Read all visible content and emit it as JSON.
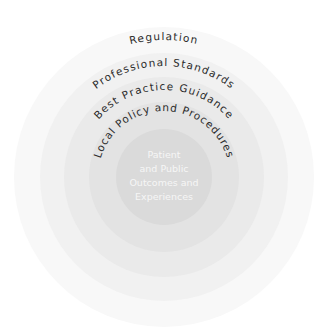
{
  "diagram": {
    "type": "concentric-circles",
    "center": {
      "x": 164,
      "y": 177
    },
    "rings": [
      {
        "id": "regulation",
        "label": "Regulation",
        "radius": 150,
        "fill": "#f8f8f8",
        "label_radius": 137,
        "label_offset": "50%"
      },
      {
        "id": "professional-standards",
        "label": "Professional Standards",
        "radius": 124,
        "fill": "#f1f1f1",
        "label_radius": 111,
        "label_offset": "50%"
      },
      {
        "id": "best-practice-guidance",
        "label": "Best Practice Guidance",
        "radius": 100,
        "fill": "#eaeaea",
        "label_radius": 87,
        "label_offset": "50%"
      },
      {
        "id": "local-policy",
        "label": "Local Policy and Procedures",
        "radius": 75,
        "fill": "#e4e4e4",
        "label_radius": 62,
        "label_offset": "50%"
      }
    ],
    "core": {
      "radius": 48,
      "fill": "#dadada",
      "lines": [
        "Patient",
        "and Public",
        "Outcomes and",
        "Experiences"
      ]
    },
    "text_color": "#2b2b2b",
    "core_text_color": "#f6f6f6"
  }
}
